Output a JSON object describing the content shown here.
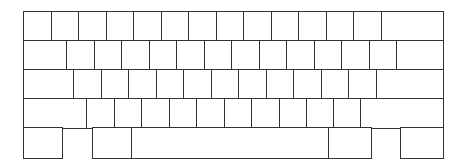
{
  "diagram": {
    "type": "keyboard-layout-outline",
    "stroke_color": "#333333",
    "fill_color": "#ffffff",
    "rows": [
      {
        "name": "row-1",
        "top": 11,
        "height": 29,
        "keys": [
          [
            23,
            50.5
          ],
          [
            50.5,
            78
          ],
          [
            78,
            105.5
          ],
          [
            105.5,
            133
          ],
          [
            133,
            160.5
          ],
          [
            160.5,
            188
          ],
          [
            188,
            215.5
          ],
          [
            215.5,
            243
          ],
          [
            243,
            270.5
          ],
          [
            270.5,
            298
          ],
          [
            298,
            325.5
          ],
          [
            325.5,
            353
          ],
          [
            353,
            381
          ],
          [
            381,
            442
          ]
        ]
      },
      {
        "name": "row-2",
        "top": 40,
        "height": 29,
        "keys": [
          [
            23,
            66
          ],
          [
            66,
            93.5
          ],
          [
            93.5,
            121
          ],
          [
            121,
            148.5
          ],
          [
            148.5,
            176
          ],
          [
            176,
            203.5
          ],
          [
            203.5,
            231
          ],
          [
            231,
            258.5
          ],
          [
            258.5,
            286
          ],
          [
            286,
            313.5
          ],
          [
            313.5,
            341
          ],
          [
            341,
            368.5
          ],
          [
            368.5,
            396
          ],
          [
            396,
            442
          ]
        ]
      },
      {
        "name": "row-3",
        "top": 69,
        "height": 29,
        "keys": [
          [
            23,
            73
          ],
          [
            73,
            100.5
          ],
          [
            100.5,
            128
          ],
          [
            128,
            155.5
          ],
          [
            155.5,
            183
          ],
          [
            183,
            210.5
          ],
          [
            210.5,
            238
          ],
          [
            238,
            265.5
          ],
          [
            265.5,
            293
          ],
          [
            293,
            320.5
          ],
          [
            320.5,
            348
          ],
          [
            348,
            376
          ],
          [
            376,
            442
          ]
        ]
      },
      {
        "name": "row-4",
        "top": 98,
        "height": 29,
        "keys": [
          [
            23,
            86
          ],
          [
            86,
            113.5
          ],
          [
            113.5,
            141
          ],
          [
            141,
            168.5
          ],
          [
            168.5,
            196
          ],
          [
            196,
            223.5
          ],
          [
            223.5,
            251
          ],
          [
            251,
            278.5
          ],
          [
            278.5,
            306
          ],
          [
            306,
            333
          ],
          [
            333,
            360
          ],
          [
            360,
            442
          ]
        ]
      },
      {
        "name": "row-5",
        "top": 127,
        "height": 30,
        "keys": [
          [
            23,
            61
          ],
          [
            92,
            131
          ],
          [
            131,
            328
          ],
          [
            328,
            370
          ],
          [
            400,
            442
          ]
        ]
      }
    ]
  }
}
